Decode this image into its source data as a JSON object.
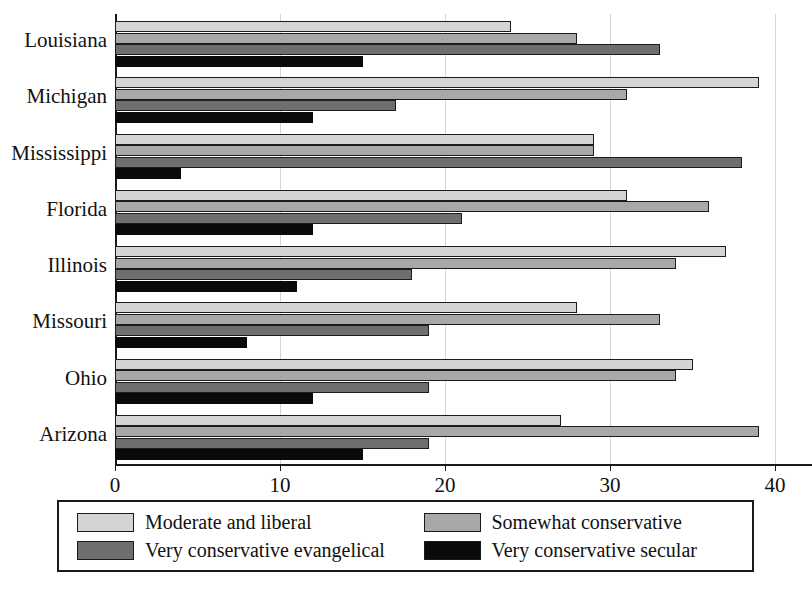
{
  "chart_data": {
    "type": "bar",
    "orientation": "horizontal",
    "title": "",
    "xlabel": "",
    "ylabel": "",
    "xlim": [
      0,
      40
    ],
    "xticks": [
      0,
      10,
      20,
      30,
      40
    ],
    "xtick_labels": [
      "0",
      "10",
      "20",
      "30",
      "40"
    ],
    "grid": true,
    "legend_position": "bottom",
    "categories": [
      "Louisiana",
      "Michigan",
      "Mississippi",
      "Florida",
      "Illinois",
      "Missouri",
      "Ohio",
      "Arizona"
    ],
    "series": [
      {
        "name": "Moderate and liberal",
        "color": "#d4d4d4",
        "values": [
          24,
          39,
          29,
          31,
          37,
          28,
          35,
          27
        ]
      },
      {
        "name": "Somewhat conservative",
        "color": "#a8a8a8",
        "values": [
          28,
          31,
          29,
          36,
          34,
          33,
          34,
          39
        ]
      },
      {
        "name": "Very conservative evangelical",
        "color": "#6e6e6e",
        "values": [
          33,
          17,
          38,
          21,
          18,
          19,
          19,
          19
        ]
      },
      {
        "name": "Very conservative secular",
        "color": "#0a0a0a",
        "values": [
          15,
          12,
          4,
          12,
          11,
          8,
          12,
          15
        ]
      }
    ]
  },
  "legend": {
    "items": [
      {
        "label": "Moderate and liberal",
        "color": "#d4d4d4"
      },
      {
        "label": "Somewhat conservative",
        "color": "#a8a8a8"
      },
      {
        "label": "Very conservative evangelical",
        "color": "#6e6e6e"
      },
      {
        "label": "Very conservative secular",
        "color": "#0a0a0a"
      }
    ]
  }
}
